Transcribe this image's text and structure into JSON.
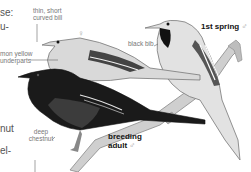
{
  "illustration": {
    "subject": "orchard oriole plumages",
    "colors": {
      "background": "#ffffff",
      "label_text": "#777777",
      "bold_label_text": "#111111",
      "male_plumage": "#1a1a1a",
      "chestnut": "#3c3c3c",
      "female_plumage": "#d8d8d8",
      "branch": "#c8c8c8"
    }
  },
  "side_text": {
    "line1": "se:",
    "line2": "u-",
    "line3": "nut",
    "line4": "el-"
  },
  "labels": {
    "bill": [
      "thin, short",
      "curved bill"
    ],
    "underparts": [
      "mon yellow",
      "underparts"
    ],
    "bib": "black bib",
    "chestnut": [
      "deep",
      "chestnut"
    ],
    "female_symbol": "♀"
  },
  "plumage_titles": {
    "first_spring": {
      "text": "1st spring",
      "symbol": "♂"
    },
    "breeding": {
      "line1": "breeding",
      "line2": "adult",
      "symbol": "♂"
    }
  }
}
